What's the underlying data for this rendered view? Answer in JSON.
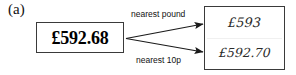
{
  "figure": {
    "part_label": "(a)",
    "type": "rounding-flow-diagram"
  },
  "source": {
    "value": "£592.68",
    "name": "original-amount"
  },
  "arrows": [
    {
      "label": "nearest pound",
      "from": "source-value-box",
      "to": "result-row-1",
      "direction": "up-right"
    },
    {
      "label": "nearest 10p",
      "from": "source-value-box",
      "to": "result-row-2",
      "direction": "down-right"
    }
  ],
  "labels": {
    "nearest_pound": "nearest pound",
    "nearest_10p": "nearest 10p"
  },
  "results": [
    {
      "value": "£593",
      "rounding": "nearest pound"
    },
    {
      "value": "£592.70",
      "rounding": "nearest 10p"
    }
  ],
  "colors": {
    "background": "#ffffff",
    "box_border": "#3a3a3a",
    "source_text": "#000000",
    "result_text": "#2b2b2b",
    "arrow": "#1a1a1a",
    "label_text": "#111111"
  }
}
